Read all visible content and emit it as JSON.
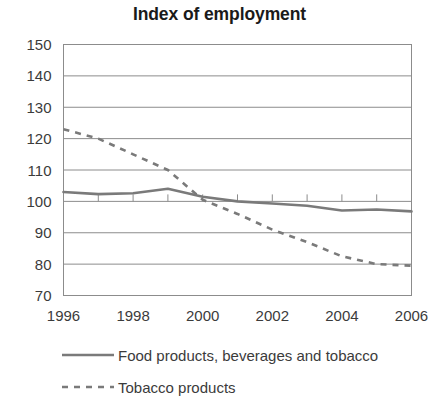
{
  "chart_data": {
    "type": "line",
    "title": "Index of employment",
    "xlabel": "",
    "ylabel": "",
    "xlim": [
      1996,
      2006
    ],
    "ylim": [
      70,
      150
    ],
    "yticks": [
      70,
      80,
      90,
      100,
      110,
      120,
      130,
      140,
      150
    ],
    "ytick_labels": [
      "70",
      "80",
      "90",
      "100",
      "110",
      "120",
      "130",
      "140",
      "150"
    ],
    "xticks": [
      1996,
      1997,
      1998,
      1999,
      2000,
      2001,
      2002,
      2003,
      2004,
      2005,
      2006
    ],
    "xtick_labels": [
      "1996",
      "",
      "1998",
      "",
      "2000",
      "",
      "2002",
      "",
      "2004",
      "",
      "2006"
    ],
    "xtick_labels_shown": [
      "1996",
      "1998",
      "2000",
      "2002",
      "2004",
      "2006"
    ],
    "grid": "horizontal",
    "legend_position": "below",
    "x": [
      1996,
      1997,
      1998,
      1999,
      2000,
      2001,
      2002,
      2003,
      2004,
      2005,
      2006
    ],
    "series": [
      {
        "name": "Food products, beverages and tobacco",
        "style": "solid",
        "color": "#7a7a7a",
        "values": [
          103,
          102.3,
          102.6,
          104,
          101.5,
          100,
          99.3,
          98.6,
          97.1,
          97.4,
          96.8
        ]
      },
      {
        "name": "Tobacco products",
        "style": "dashed",
        "color": "#7a7a7a",
        "values": [
          123,
          120,
          115,
          110,
          100.5,
          96,
          91,
          87,
          82.5,
          80,
          79.5
        ]
      }
    ]
  },
  "legend": {
    "items": [
      {
        "label": "Food products, beverages and tobacco",
        "style": "solid"
      },
      {
        "label": "Tobacco products",
        "style": "dashed"
      }
    ]
  },
  "colors": {
    "line": "#7a7a7a",
    "grid": "#8c8c8c",
    "axis": "#6e6e6e",
    "text": "#3b3b3b",
    "title": "#1a1a1a",
    "background": "#ffffff"
  }
}
